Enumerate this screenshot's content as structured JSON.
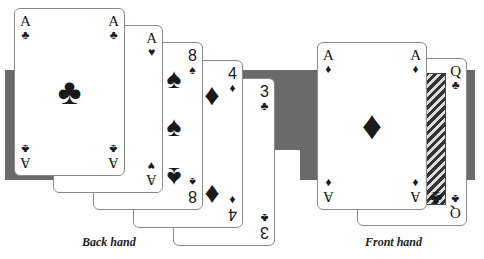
{
  "labels": {
    "back_hand": "Back hand",
    "front_hand": "Front hand"
  },
  "colors": {
    "band": "#6a6a6a",
    "card_border": "#8a8a8a",
    "ink": "#1a1a1a"
  },
  "back_hand": [
    {
      "rank": "A",
      "suit": "♣",
      "suit_name": "clubs"
    },
    {
      "rank": "A",
      "suit": "♥",
      "suit_name": "hearts"
    },
    {
      "rank": "8",
      "suit": "♠",
      "suit_name": "spades"
    },
    {
      "rank": "4",
      "suit": "♦",
      "suit_name": "diamonds"
    },
    {
      "rank": "3",
      "suit": "♣",
      "suit_name": "clubs"
    }
  ],
  "front_hand": [
    {
      "rank": "A",
      "suit": "♦",
      "suit_name": "diamonds"
    },
    {
      "rank": "Q",
      "suit": "♣",
      "suit_name": "clubs"
    }
  ]
}
